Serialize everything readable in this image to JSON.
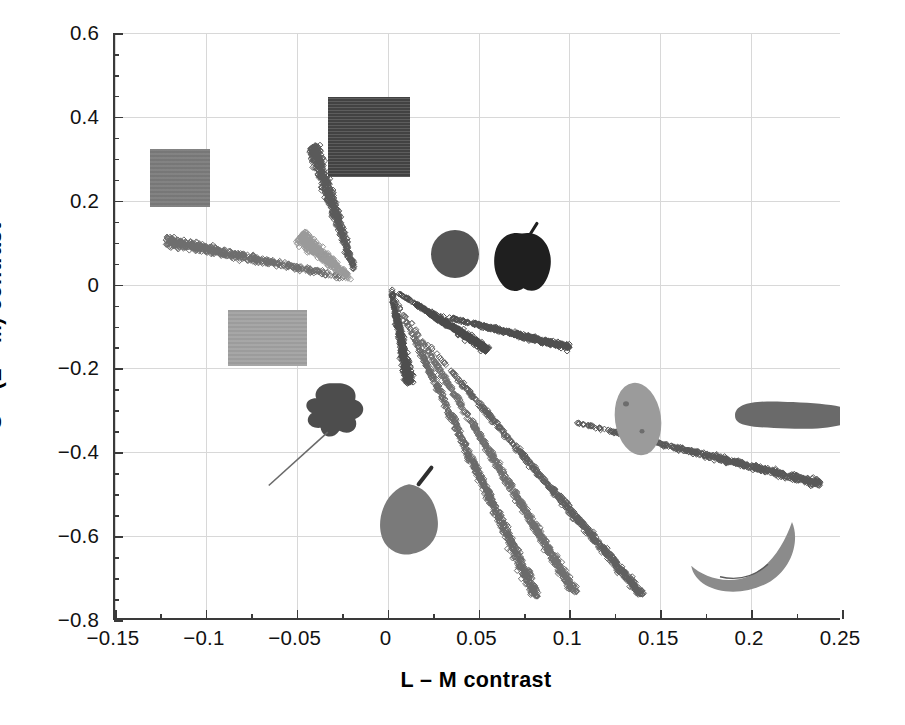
{
  "chart_data": {
    "type": "scatter",
    "title": "",
    "xlabel": "L – M contrast",
    "ylabel": "S – (L + M) contrast",
    "xlim": [
      -0.15,
      0.25
    ],
    "ylim": [
      -0.8,
      0.6
    ],
    "xticks": [
      -0.15,
      -0.1,
      -0.05,
      0,
      0.05,
      0.1,
      0.15,
      0.2,
      0.25
    ],
    "xticklabels": [
      "−0.15",
      "−0.1",
      "−0.05",
      "0",
      "0.05",
      "0.1",
      "0.15",
      "0.2",
      "0.25"
    ],
    "yticks": [
      0.6,
      0.4,
      0.2,
      0,
      -0.2,
      -0.4,
      -0.6,
      -0.8
    ],
    "yticklabels": [
      "0.6",
      "0.4",
      "0.2",
      "0",
      "−0.2",
      "−0.4",
      "−0.6",
      "−0.8"
    ],
    "minor_tick_step_x": 0.025,
    "minor_tick_step_y": 0.05,
    "grid": true,
    "legend": "none",
    "marker": "open-diamond",
    "series": [
      {
        "name": "blue-violet-object",
        "color": "#5a5a5a",
        "x_start": -0.018,
        "y_start": 0.03,
        "x_end": -0.041,
        "y_end": 0.33,
        "spread": 0.03,
        "n": 520,
        "comment": "steep upward cluster reaching 0.41"
      },
      {
        "name": "grey-patch-object",
        "color": "#6e6e6e",
        "x_start": -0.022,
        "y_start": 0.015,
        "x_end": -0.122,
        "y_end": 0.105,
        "spread": 0.026,
        "n": 480,
        "comment": "leftward cluster toward -0.13, 0.13"
      },
      {
        "name": "light-grey-fan",
        "color": "#9a9a9a",
        "x_start": -0.02,
        "y_start": 0.012,
        "x_end": -0.048,
        "y_end": 0.115,
        "spread": 0.034,
        "n": 430,
        "comment": "broad pale fan overlapping upward cluster"
      },
      {
        "name": "leaf-object",
        "color": "#4e4e4e",
        "x_start": 0.002,
        "y_start": -0.01,
        "x_end": 0.012,
        "y_end": -0.235,
        "spread": 0.02,
        "n": 400
      },
      {
        "name": "apple-object",
        "color": "#4a4a4a",
        "x_start": 0.006,
        "y_start": -0.02,
        "x_end": 0.055,
        "y_end": -0.155,
        "spread": 0.018,
        "n": 430
      },
      {
        "name": "orange-object",
        "color": "#4f4f4f",
        "x_start": 0.03,
        "y_start": -0.075,
        "x_end": 0.1,
        "y_end": -0.15,
        "spread": 0.014,
        "n": 420
      },
      {
        "name": "pear-object",
        "color": "#6a6a6a",
        "x_start": 0.004,
        "y_start": -0.03,
        "x_end": 0.082,
        "y_end": -0.745,
        "spread": 0.022,
        "n": 700
      },
      {
        "name": "banana-object",
        "color": "#707070",
        "x_start": 0.01,
        "y_start": -0.07,
        "x_end": 0.103,
        "y_end": -0.735,
        "spread": 0.02,
        "n": 640
      },
      {
        "name": "potato-object",
        "color": "#606060",
        "x_start": 0.018,
        "y_start": -0.12,
        "x_end": 0.14,
        "y_end": -0.74,
        "spread": 0.018,
        "n": 620
      },
      {
        "name": "carrot-object",
        "color": "#585858",
        "x_start": 0.1,
        "y_start": -0.325,
        "x_end": 0.238,
        "y_end": -0.475,
        "spread": 0.016,
        "n": 560
      }
    ],
    "stimulus_images": [
      {
        "name": "grey-square-patch",
        "x": -0.114,
        "y": 0.253,
        "w": 60,
        "h": 58,
        "fill": "#7c7c7c"
      },
      {
        "name": "dark-texture-patch",
        "x": -0.01,
        "y": 0.353,
        "w": 82,
        "h": 80,
        "fill": "#4b4b4b"
      },
      {
        "name": "light-grey-patch",
        "x": -0.066,
        "y": -0.127,
        "w": 79,
        "h": 56,
        "fill": "#a2a2a2"
      },
      {
        "name": "leaf-image",
        "x": -0.029,
        "y": -0.3,
        "w": 72,
        "h": 74,
        "fill": "#4d4d4d"
      },
      {
        "name": "pear-image",
        "x": 0.012,
        "y": -0.537,
        "w": 80,
        "h": 92,
        "fill": "#7a7a7a"
      },
      {
        "name": "orange-image",
        "x": 0.037,
        "y": 0.073,
        "w": 50,
        "h": 50,
        "fill": "#555555"
      },
      {
        "name": "apple-image",
        "x": 0.074,
        "y": 0.064,
        "w": 68,
        "h": 72,
        "fill": "#1f1f1f"
      },
      {
        "name": "potato-image",
        "x": 0.138,
        "y": -0.321,
        "w": 50,
        "h": 76,
        "fill": "#9b9b9b"
      },
      {
        "name": "carrot-image",
        "x": 0.223,
        "y": -0.311,
        "w": 126,
        "h": 34,
        "fill": "#6a6a6a"
      },
      {
        "name": "banana-image",
        "x": 0.196,
        "y": -0.651,
        "w": 120,
        "h": 78,
        "fill": "#8b8b8b"
      }
    ]
  },
  "axes": {
    "x_title": "L – M contrast",
    "y_title": "S – (L + M) contrast"
  }
}
